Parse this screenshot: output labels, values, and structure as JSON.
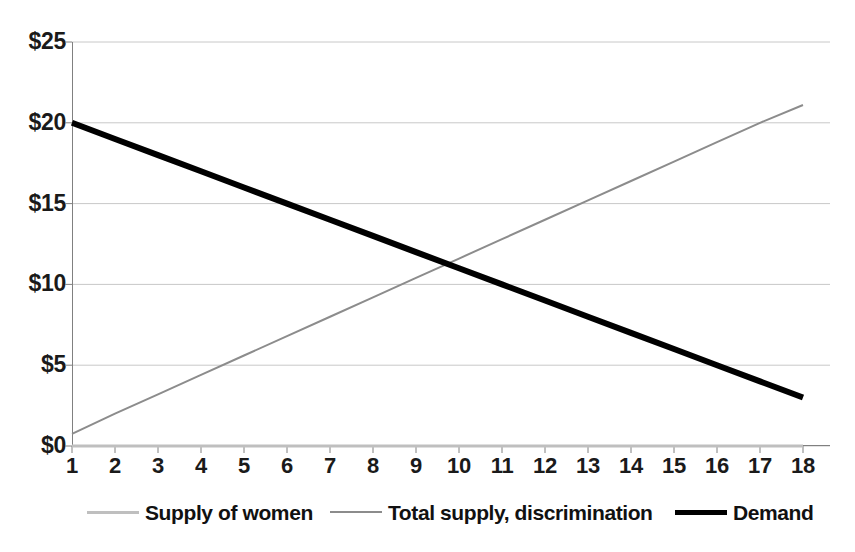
{
  "chart_data": {
    "type": "line",
    "title": "",
    "subtitle": "",
    "xlabel": "",
    "ylabel": "",
    "x": [
      1,
      2,
      3,
      4,
      5,
      6,
      7,
      8,
      9,
      10,
      11,
      12,
      13,
      14,
      15,
      16,
      17,
      18
    ],
    "xlim": [
      1,
      18
    ],
    "ylim": [
      0,
      25
    ],
    "y_tick_labels": [
      "$0",
      "$5",
      "$10",
      "$15",
      "$20",
      "$25"
    ],
    "y_tick_values": [
      0,
      5,
      10,
      15,
      20,
      25
    ],
    "x_tick_labels": [
      "1",
      "2",
      "3",
      "4",
      "5",
      "6",
      "7",
      "8",
      "9",
      "10",
      "11",
      "12",
      "13",
      "14",
      "15",
      "16",
      "17",
      "18"
    ],
    "grid": "horizontal",
    "legend_position": "bottom",
    "series": [
      {
        "name": "Supply of women",
        "color": "#bfbfbf",
        "width": 3,
        "values": [
          0,
          0,
          0,
          0,
          0,
          0,
          0,
          0,
          0,
          0,
          0,
          0,
          0,
          0,
          0,
          0,
          0,
          0
        ]
      },
      {
        "name": "Total supply, discrimination",
        "color": "#8c8c8c",
        "width": 2,
        "values": [
          0.75,
          2.0,
          3.2,
          4.4,
          5.6,
          6.8,
          8.0,
          9.2,
          10.4,
          11.6,
          12.8,
          14.0,
          15.2,
          16.4,
          17.6,
          18.8,
          20.0,
          21.1
        ]
      },
      {
        "name": "Demand",
        "color": "#000000",
        "width": 6,
        "values": [
          20,
          19,
          18,
          17,
          16,
          15,
          14,
          13,
          12,
          11,
          10,
          9,
          8,
          7,
          6,
          5,
          4,
          3
        ]
      }
    ],
    "annotations": [],
    "colors": {
      "axis": "#808080",
      "grid": "#c8c8c8",
      "text": "#111111",
      "background": "#ffffff"
    }
  },
  "legend": {
    "items": [
      {
        "label": "Supply of women",
        "color": "#bfbfbf",
        "width": 3,
        "left": 87
      },
      {
        "label": "Total supply, discrimination",
        "color": "#8c8c8c",
        "width": 2,
        "left": 330
      },
      {
        "label": "Demand",
        "color": "#000000",
        "width": 5,
        "left": 675
      }
    ]
  }
}
